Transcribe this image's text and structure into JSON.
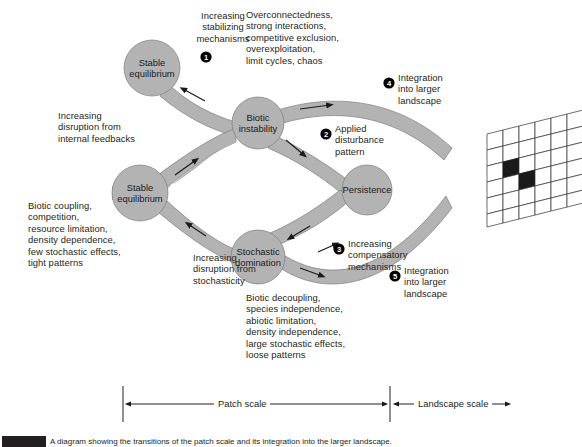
{
  "figure": {
    "caption_label": "FIGURE",
    "caption_text": "A diagram showing the transitions of the patch scale and its integration into the larger landscape."
  },
  "colors": {
    "band": "#b3b3b3",
    "band_stroke": "#6e6e6e",
    "node_fill": "#b3b3b3",
    "badge_fill": "#000000",
    "badge_text": "#ffffff",
    "text": "#231f20",
    "grid_stroke": "#3a3a3a",
    "grid_fill": "#ffffff",
    "grid_dark_cell": "#1a1a1a",
    "grid_side": "#ffffff"
  },
  "nodes": [
    {
      "id": "stable-equilibrium-top",
      "line1": "Stable",
      "line2": "equilibrium",
      "cx": 152,
      "cy": 68,
      "r": 28
    },
    {
      "id": "stable-equilibrium-left",
      "line1": "Stable",
      "line2": "equilibrium",
      "cx": 140,
      "cy": 193,
      "r": 28
    },
    {
      "id": "biotic-instability",
      "line1": "Biotic",
      "line2": "instability",
      "cx": 258,
      "cy": 123,
      "r": 26
    },
    {
      "id": "stochastic-domination",
      "line1": "Stochastic",
      "line2": "domination",
      "cx": 258,
      "cy": 257,
      "r": 27
    },
    {
      "id": "persistence",
      "line1": "Persistence",
      "line2": "",
      "cx": 367,
      "cy": 190,
      "r": 25
    }
  ],
  "badges": [
    {
      "num": "1",
      "x": 206,
      "y": 57
    },
    {
      "num": "2",
      "x": 326,
      "y": 134
    },
    {
      "num": "3",
      "x": 339,
      "y": 249
    },
    {
      "num": "4",
      "x": 389,
      "y": 83
    },
    {
      "num": "5",
      "x": 395,
      "y": 276
    }
  ],
  "annotations": [
    {
      "id": "increasing-stabilizing-mechanisms",
      "text": "Increasing\nstabilizing\nmechanisms",
      "x": 192,
      "y": 10,
      "align": "left"
    },
    {
      "id": "overconnectedness-list",
      "text": "Overconnectedness,\nstrong interactions,\ncompetitive exclusion,\noverexploitation,\nlimit cycles, chaos",
      "x": 246,
      "y": 9,
      "align": "left"
    },
    {
      "id": "increasing-disruption-internal",
      "text": "Increasing\ndisruption from\ninternal feedbacks",
      "x": 58,
      "y": 110,
      "align": "left"
    },
    {
      "id": "biotic-coupling-list",
      "text": "Biotic coupling,\ncompetition,\nresource limitation,\ndensity dependence,\nfew stochastic effects,\ntight patterns",
      "x": 28,
      "y": 200,
      "align": "left"
    },
    {
      "id": "increasing-disruption-stochasticity",
      "text": "Increasing\ndisruption from\nstochasticity",
      "x": 193,
      "y": 252,
      "align": "left"
    },
    {
      "id": "biotic-decoupling-list",
      "text": "Biotic decoupling,\nspecies independence,\nabiotic limitation,\ndensity independence,\nlarge stochastic effects,\nloose patterns",
      "x": 246,
      "y": 292,
      "align": "left"
    },
    {
      "id": "applied-disturbance-pattern",
      "text": "Applied\ndisturbance\npattern",
      "x": 335,
      "y": 123,
      "align": "left"
    },
    {
      "id": "increasing-compensatory-mechanisms",
      "text": "Increasing\ncompensatory\nmechanisms",
      "x": 348,
      "y": 238,
      "align": "left"
    },
    {
      "id": "integration-into-larger-landscape-top",
      "text": "Integration\ninto larger\nlandscape",
      "x": 398,
      "y": 72,
      "align": "left"
    },
    {
      "id": "integration-into-larger-landscape-bottom",
      "text": "Integration\ninto larger\nlandscape",
      "x": 404,
      "y": 265,
      "align": "left"
    }
  ],
  "scale_axis": {
    "y": 404,
    "left_x": 123,
    "divider_x": 390,
    "right_x": 510,
    "tick_top": 386,
    "tick_bottom": 422,
    "segments": [
      {
        "id": "patch-scale",
        "label": "Patch scale",
        "from": 123,
        "to": 390
      },
      {
        "id": "landscape-scale",
        "label": "Landscape scale",
        "from": 390,
        "to": 510
      }
    ]
  },
  "landscape_grid": {
    "id": "landscape-block-grid",
    "cols": 6,
    "rows": 5,
    "dark_cells": [
      {
        "col": 1,
        "row": 2
      },
      {
        "col": 2,
        "row": 3
      }
    ],
    "origin_x": 487,
    "origin_y": 134
  }
}
